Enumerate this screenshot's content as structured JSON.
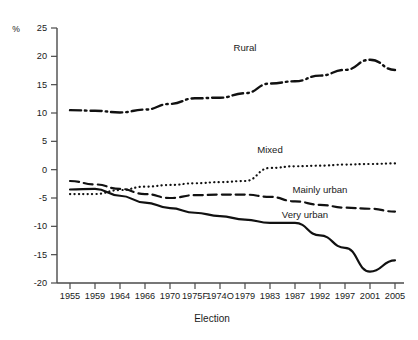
{
  "chart_data": {
    "type": "line",
    "title": "",
    "xlabel": "Election",
    "ylabel": "%",
    "ylim": [
      -20,
      25
    ],
    "yticks": [
      25,
      20,
      15,
      10,
      5,
      0,
      -5,
      -10,
      -15,
      -20
    ],
    "grid": false,
    "legend_position": "inline-annotations",
    "categories": [
      "1955",
      "1959",
      "1964",
      "1966",
      "1970",
      "1975F",
      "1974O",
      "1979",
      "1983",
      "1987",
      "1992",
      "1997",
      "2001",
      "2005"
    ],
    "series": [
      {
        "name": "Rural",
        "style": "dash-dot",
        "values": [
          10.5,
          10.4,
          10.1,
          10.6,
          11.6,
          12.6,
          12.7,
          13.5,
          15.2,
          15.6,
          16.6,
          17.6,
          19.4,
          17.6
        ]
      },
      {
        "name": "Mixed",
        "style": "dotted",
        "values": [
          -4.3,
          -4.3,
          -3.6,
          -3.0,
          -2.7,
          -2.4,
          -2.2,
          -2.0,
          0.3,
          0.6,
          0.7,
          0.9,
          1.0,
          1.1
        ]
      },
      {
        "name": "Mainly urban",
        "style": "dashed",
        "values": [
          -2.0,
          -2.6,
          -3.4,
          -4.3,
          -5.0,
          -4.5,
          -4.4,
          -4.4,
          -4.8,
          -5.6,
          -6.2,
          -6.7,
          -6.9,
          -7.4
        ]
      },
      {
        "name": "Very urban",
        "style": "solid",
        "values": [
          -3.5,
          -3.4,
          -4.6,
          -5.8,
          -6.8,
          -7.6,
          -8.2,
          -8.8,
          -9.4,
          -9.4,
          -11.6,
          -13.8,
          -18.0,
          -16.0
        ]
      }
    ],
    "annotations": [
      {
        "text": "Rural",
        "x": 1975,
        "y": 21.0
      },
      {
        "text": "Mixed",
        "x": 1983,
        "y": 3.0
      },
      {
        "text": "Mainly urban",
        "x": 1990,
        "y": -4.2
      },
      {
        "text": "Very urban",
        "x": 1988,
        "y": -8.6
      }
    ]
  },
  "axes": {
    "y_unit": "%",
    "x_title": "Election"
  }
}
